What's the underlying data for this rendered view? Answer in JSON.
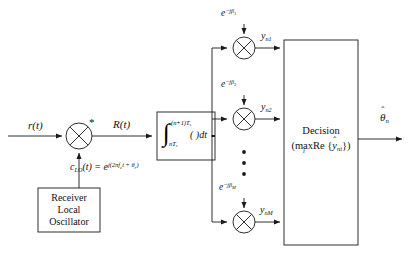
{
  "diagram": {
    "input_signal": "r(t)",
    "mixer_conjugate_mark": "*",
    "downconverted_signal": "R(t)",
    "lo_equation_lhs": "c",
    "lo_equation_lhs_sub": "LO",
    "lo_equation_lhs_arg": "(t) =",
    "lo_equation_rhs_base": "e",
    "lo_equation_rhs_exp": "j(2πf",
    "lo_equation_rhs_exp_sub": "c",
    "lo_equation_rhs_exp_tail": "t + θ",
    "lo_equation_rhs_exp_tail_sub": "r",
    "lo_equation_rhs_exp_close": ")",
    "oscillator_box": {
      "line1": "Receiver",
      "line2": "Local",
      "line3": "Oscillator"
    },
    "integrator": {
      "symbol": "∫",
      "upper_limit": "(n+1)T",
      "upper_limit_sub": "s",
      "lower_limit": "nT",
      "lower_limit_sub": "s",
      "integrand": "(  )dt"
    },
    "branches": [
      {
        "phase_base": "e",
        "phase_exp": "−jβ",
        "phase_index": "1",
        "output_base": "y",
        "output_sub": "n1"
      },
      {
        "phase_base": "e",
        "phase_exp": "−jβ",
        "phase_index": "2",
        "output_base": "y",
        "output_sub": "n2"
      },
      {
        "phase_base": "e",
        "phase_exp": "−jβ",
        "phase_index": "M",
        "output_base": "y",
        "output_sub": "nM"
      }
    ],
    "ellipsis_dots": 3,
    "decision_box": {
      "title": "Decision",
      "rule_open": "(",
      "rule_max": "max",
      "rule_max_index": "i",
      "rule_re": "Re {",
      "rule_var": "y",
      "rule_var_hat": "ˆ",
      "rule_var_sub": "ni",
      "rule_close": "})"
    },
    "output_symbol": "θ",
    "output_hat": "ˆ",
    "output_sub": "n",
    "colors": {
      "line": "#1a1a1a",
      "text": "#111111",
      "background": "#ffffff"
    }
  }
}
